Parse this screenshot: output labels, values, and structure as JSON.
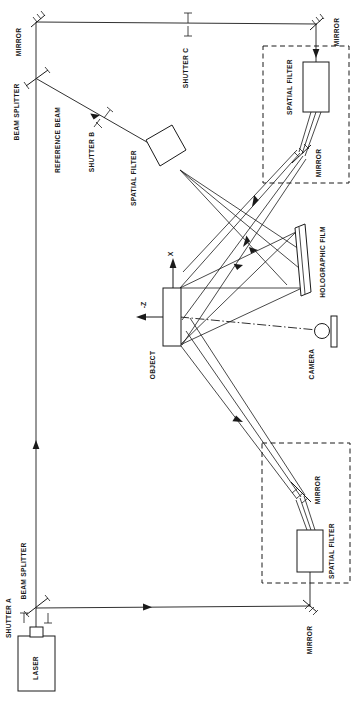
{
  "figure": {
    "orientation": "rotated-90-counterclockwise",
    "background_color": "#ffffff",
    "ink_color": "#1a1a1a"
  },
  "labels": {
    "laser": "LASER",
    "shutter_a": "SHUTTER A",
    "shutter_b": "SHUTTER B",
    "shutter_c": "SHUTTER C",
    "beam_splitter_top": "BEAM SPLITTER",
    "beam_splitter_bottom": "BEAM SPLITTER",
    "mirror_top_left": "MIRROR",
    "mirror_top_right": "MIRROR",
    "mirror_upper_box": "MIRROR",
    "mirror_lower_box": "MIRROR",
    "mirror_bottom_right": "MIRROR",
    "reference_beam": "REFERENCE BEAM",
    "spatial_filter_reference": "SPATIAL FILTER",
    "spatial_filter_upper": "SPATIAL FILTER",
    "spatial_filter_lower": "SPATIAL FILTER",
    "holographic_film": "HOLOGRAPHIC FILM",
    "object": "OBJECT",
    "camera": "CAMERA",
    "axis_x": "X",
    "axis_z": "-Z"
  },
  "components": [
    {
      "name": "laser",
      "label": "LASER",
      "shape": "rectangle-with-aperture-nub"
    },
    {
      "name": "shutter-a",
      "label": "SHUTTER A",
      "shape": "paired-t-marks"
    },
    {
      "name": "beam-splitter-bottom",
      "label": "BEAM SPLITTER",
      "shape": "tilted-plate-with-ticks"
    },
    {
      "name": "beam-splitter-top",
      "label": "BEAM SPLITTER",
      "shape": "tilted-plate-with-ticks"
    },
    {
      "name": "mirror-top-left",
      "label": "MIRROR",
      "shape": "hatched-mirror"
    },
    {
      "name": "mirror-top-right",
      "label": "MIRROR",
      "shape": "hatched-mirror"
    },
    {
      "name": "mirror-bottom-right",
      "label": "MIRROR",
      "shape": "hatched-mirror"
    },
    {
      "name": "shutter-b",
      "label": "SHUTTER B",
      "shape": "paired-t-marks"
    },
    {
      "name": "shutter-c",
      "label": "SHUTTER C",
      "shape": "paired-t-marks"
    },
    {
      "name": "spatial-filter-reference",
      "label": "SPATIAL FILTER",
      "shape": "tilted-rectangle"
    },
    {
      "name": "spatial-filter-upper",
      "label": "SPATIAL FILTER",
      "shape": "rectangle"
    },
    {
      "name": "spatial-filter-lower",
      "label": "SPATIAL FILTER",
      "shape": "rectangle"
    },
    {
      "name": "mirror-upper-box",
      "label": "MIRROR",
      "shape": "hatched-mirror"
    },
    {
      "name": "mirror-lower-box",
      "label": "MIRROR",
      "shape": "hatched-mirror"
    },
    {
      "name": "holographic-film",
      "label": "HOLOGRAPHIC FILM",
      "shape": "angled-plate"
    },
    {
      "name": "object",
      "label": "OBJECT",
      "shape": "rectangle"
    },
    {
      "name": "camera",
      "label": "CAMERA",
      "shape": "circle-lens-with-body"
    },
    {
      "name": "illumination-enclosure-upper",
      "label": "",
      "shape": "dashed-boundary"
    },
    {
      "name": "illumination-enclosure-lower",
      "label": "",
      "shape": "dashed-boundary"
    }
  ],
  "axes": {
    "x_label": "X",
    "z_label": "-Z",
    "origin_note": "object-centered"
  }
}
